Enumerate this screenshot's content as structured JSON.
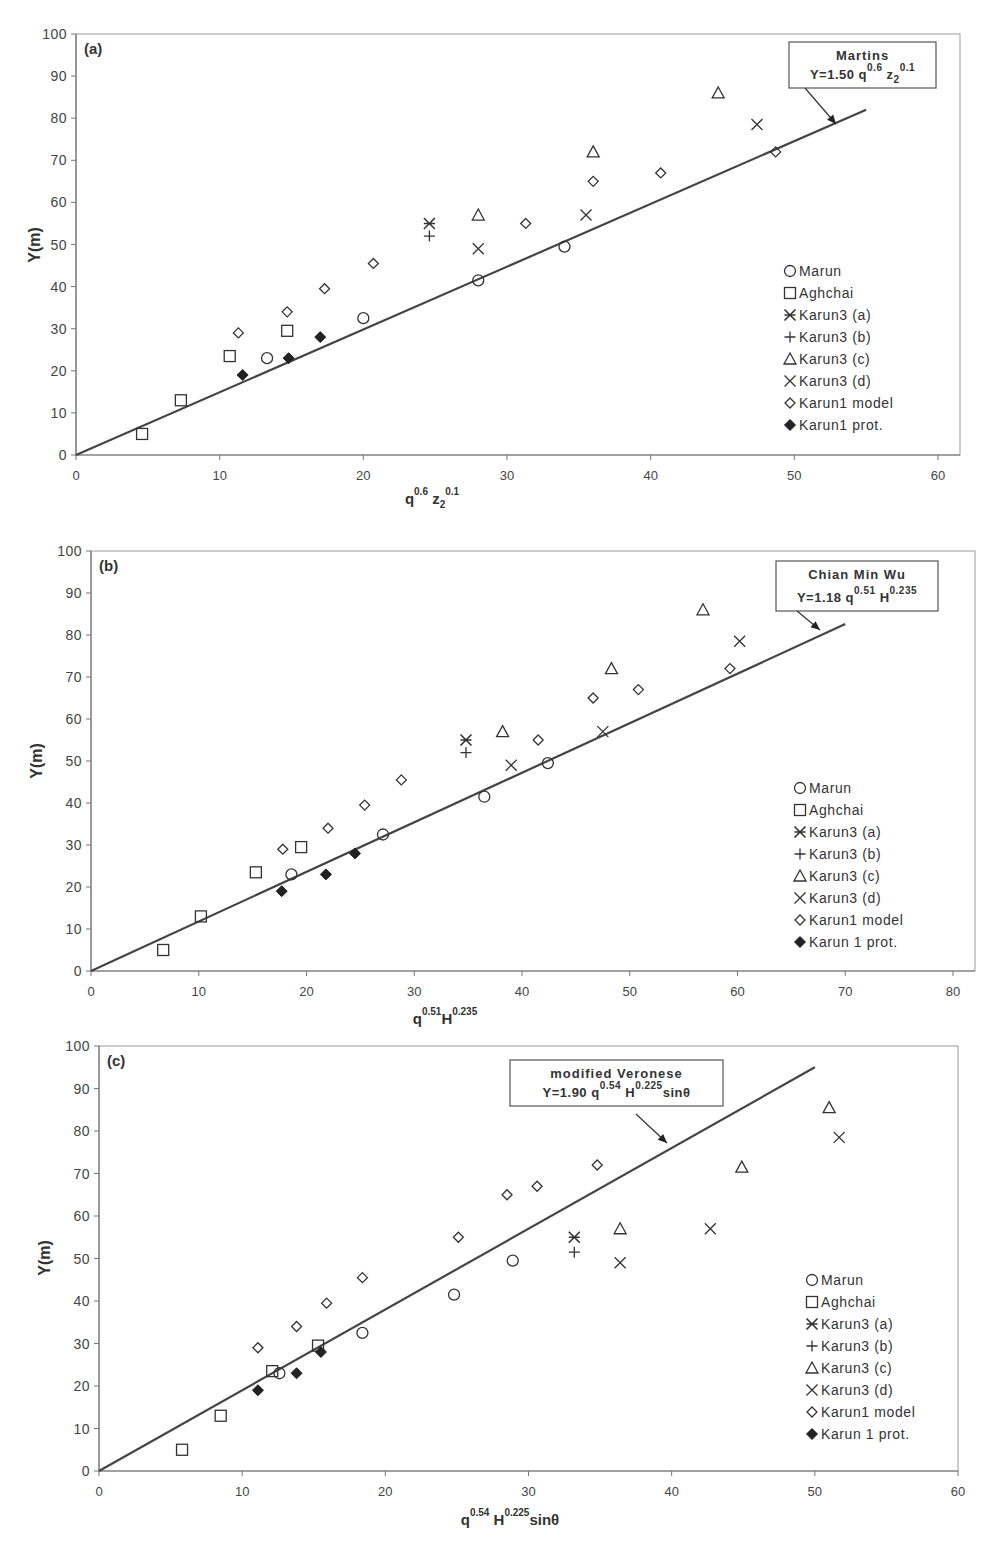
{
  "legend_labels_a": [
    "Marun",
    "Aghchai",
    "Karun3 (a)",
    "Karun3 (b)",
    "Karun3 (c)",
    "Karun3 (d)",
    "Karun1 model",
    "Karun1 prot."
  ],
  "legend_labels_b": [
    "Marun",
    "Aghchai",
    "Karun3 (a)",
    "Karun3 (b)",
    "Karun3 (c)",
    "Karun3 (d)",
    "Karun1 model",
    "Karun 1 prot."
  ],
  "legend_labels_c": [
    "Marun",
    "Aghchai",
    "Karun3 (a)",
    "Karun3 (b)",
    "Karun3 (c)",
    "Karun3 (d)",
    "Karun1 model",
    "Karun 1 prot."
  ],
  "charts": {
    "a": {
      "panel_label": "(a)",
      "ylabel": "Y(m)",
      "xlabel_base": [
        "q",
        "z"
      ],
      "xlabel_sup": [
        "0.6",
        "0.1"
      ],
      "xlabel_sub": "2",
      "box_title": "Martins",
      "box_eq_prefix": "Y=1.50 q",
      "box_eq_sup1": "0.6",
      "box_eq_mid": " z",
      "box_eq_sub": "2",
      "box_eq_sup2": "0.1"
    },
    "b": {
      "panel_label": "(b)",
      "ylabel": "Y(m)",
      "xlabel_base": [
        "q",
        "H"
      ],
      "xlabel_sup": [
        "0.51",
        "0.235"
      ],
      "box_title": "Chian Min Wu",
      "box_eq_prefix": "Y=1.18 q",
      "box_eq_sup1": "0.51",
      "box_eq_mid": " H",
      "box_eq_sup2": "0.235"
    },
    "c": {
      "panel_label": "(c)",
      "ylabel": "Y(m)",
      "xlabel_base": [
        "q",
        " H",
        "sinθ"
      ],
      "xlabel_sup": [
        "0.54",
        "0.225"
      ],
      "box_title": "modified Veronese",
      "box_eq_prefix": "Y=1.90 q",
      "box_eq_sup1": "0.54",
      "box_eq_mid": " H",
      "box_eq_sup2": "0.225",
      "box_eq_suffix": "sinθ"
    }
  },
  "chart_data": [
    {
      "type": "scatter",
      "title": "(a) Martins: Y=1.50 q^0.6 z2^0.1",
      "xlabel": "q^0.6 z2^0.1",
      "ylabel": "Y(m)",
      "xlim": [
        0,
        60
      ],
      "ylim": [
        0,
        100
      ],
      "xticks": [
        0,
        10,
        20,
        30,
        40,
        50,
        60
      ],
      "yticks": [
        0,
        10,
        20,
        30,
        40,
        50,
        60,
        70,
        80,
        90,
        100
      ],
      "grid": false,
      "legend_position": "right-middle",
      "fit_line": {
        "name": "Martins",
        "equation": "Y=1.50 q^0.6 z2^0.1",
        "x": [
          0,
          55
        ],
        "y": [
          0,
          82
        ]
      },
      "series": [
        {
          "name": "Marun",
          "marker": "circle-open",
          "points": [
            [
              13.3,
              23
            ],
            [
              20,
              32.5
            ],
            [
              28,
              41.5
            ],
            [
              34,
              49.5
            ]
          ]
        },
        {
          "name": "Aghchai",
          "marker": "square-open",
          "points": [
            [
              4.6,
              5
            ],
            [
              7.3,
              13
            ],
            [
              10.7,
              23.5
            ],
            [
              14.7,
              29.5
            ]
          ]
        },
        {
          "name": "Karun3 (a)",
          "marker": "asterisk",
          "points": [
            [
              24.6,
              55
            ]
          ]
        },
        {
          "name": "Karun3 (b)",
          "marker": "plus",
          "points": [
            [
              24.6,
              52
            ]
          ]
        },
        {
          "name": "Karun3 (c)",
          "marker": "triangle-open",
          "points": [
            [
              28,
              57
            ],
            [
              36,
              72
            ],
            [
              44.7,
              86
            ]
          ]
        },
        {
          "name": "Karun3 (d)",
          "marker": "x",
          "points": [
            [
              28,
              49
            ],
            [
              35.5,
              57
            ],
            [
              47.4,
              78.5
            ]
          ]
        },
        {
          "name": "Karun1 model",
          "marker": "diamond-open",
          "points": [
            [
              11.3,
              29
            ],
            [
              14.7,
              34
            ],
            [
              17.3,
              39.5
            ],
            [
              20.7,
              45.5
            ],
            [
              31.3,
              55
            ],
            [
              36,
              65
            ],
            [
              40.7,
              67
            ],
            [
              48.7,
              72
            ]
          ]
        },
        {
          "name": "Karun1 prot.",
          "marker": "diamond-filled",
          "points": [
            [
              11.6,
              19
            ],
            [
              14.8,
              23
            ],
            [
              17,
              28
            ]
          ]
        }
      ]
    },
    {
      "type": "scatter",
      "title": "(b) Chian Min Wu: Y=1.18 q^0.51 H^0.235",
      "xlabel": "q^0.51 H^0.235",
      "ylabel": "Y(m)",
      "xlim": [
        0,
        80
      ],
      "ylim": [
        0,
        100
      ],
      "xticks": [
        0,
        10,
        20,
        30,
        40,
        50,
        60,
        70,
        80
      ],
      "yticks": [
        0,
        10,
        20,
        30,
        40,
        50,
        60,
        70,
        80,
        90,
        100
      ],
      "grid": false,
      "legend_position": "right-middle",
      "fit_line": {
        "name": "Chian Min Wu",
        "equation": "Y=1.18 q^0.51 H^0.235",
        "x": [
          0,
          70
        ],
        "y": [
          0,
          82.6
        ]
      },
      "series": [
        {
          "name": "Marun",
          "marker": "circle-open",
          "points": [
            [
              18.6,
              23
            ],
            [
              27.1,
              32.5
            ],
            [
              36.5,
              41.5
            ],
            [
              42.4,
              49.5
            ]
          ]
        },
        {
          "name": "Aghchai",
          "marker": "square-open",
          "points": [
            [
              6.7,
              5
            ],
            [
              10.2,
              13
            ],
            [
              15.3,
              23.5
            ],
            [
              19.5,
              29.5
            ]
          ]
        },
        {
          "name": "Karun3 (a)",
          "marker": "asterisk",
          "points": [
            [
              34.8,
              55
            ]
          ]
        },
        {
          "name": "Karun3 (b)",
          "marker": "plus",
          "points": [
            [
              34.8,
              52
            ]
          ]
        },
        {
          "name": "Karun3 (c)",
          "marker": "triangle-open",
          "points": [
            [
              38.2,
              57
            ],
            [
              48.3,
              72
            ],
            [
              56.8,
              86
            ]
          ]
        },
        {
          "name": "Karun3 (d)",
          "marker": "x",
          "points": [
            [
              39,
              49
            ],
            [
              47.5,
              57
            ],
            [
              60.2,
              78.5
            ]
          ]
        },
        {
          "name": "Karun1 model",
          "marker": "diamond-open",
          "points": [
            [
              17.8,
              29
            ],
            [
              22,
              34
            ],
            [
              25.4,
              39.5
            ],
            [
              28.8,
              45.5
            ],
            [
              41.5,
              55
            ],
            [
              46.6,
              65
            ],
            [
              50.8,
              67
            ],
            [
              59.3,
              72
            ]
          ]
        },
        {
          "name": "Karun 1 prot.",
          "marker": "diamond-filled",
          "points": [
            [
              17.7,
              19
            ],
            [
              21.8,
              23
            ],
            [
              24.5,
              28
            ]
          ]
        }
      ]
    },
    {
      "type": "scatter",
      "title": "(c) modified Veronese: Y=1.90 q^0.54 H^0.225 sinθ",
      "xlabel": "q^0.54 H^0.225 sinθ",
      "ylabel": "Y(m)",
      "xlim": [
        0,
        60
      ],
      "ylim": [
        0,
        100
      ],
      "xticks": [
        0,
        10,
        20,
        30,
        40,
        50,
        60
      ],
      "yticks": [
        0,
        10,
        20,
        30,
        40,
        50,
        60,
        70,
        80,
        90,
        100
      ],
      "grid": false,
      "legend_position": "right-lower",
      "fit_line": {
        "name": "modified Veronese",
        "equation": "Y=1.90 q^0.54 H^0.225 sinθ",
        "x": [
          0,
          50
        ],
        "y": [
          0,
          95
        ]
      },
      "series": [
        {
          "name": "Marun",
          "marker": "circle-open",
          "points": [
            [
              12.6,
              23
            ],
            [
              18.4,
              32.5
            ],
            [
              24.8,
              41.5
            ],
            [
              28.9,
              49.5
            ]
          ]
        },
        {
          "name": "Aghchai",
          "marker": "square-open",
          "points": [
            [
              5.8,
              5
            ],
            [
              8.5,
              13
            ],
            [
              12.1,
              23.5
            ],
            [
              15.3,
              29.5
            ]
          ]
        },
        {
          "name": "Karun3 (a)",
          "marker": "asterisk",
          "points": [
            [
              33.2,
              55
            ]
          ]
        },
        {
          "name": "Karun3 (b)",
          "marker": "plus",
          "points": [
            [
              33.2,
              51.5
            ]
          ]
        },
        {
          "name": "Karun3 (c)",
          "marker": "triangle-open",
          "points": [
            [
              36.4,
              57
            ],
            [
              44.9,
              71.5
            ],
            [
              51,
              85.5
            ]
          ]
        },
        {
          "name": "Karun3 (d)",
          "marker": "x",
          "points": [
            [
              36.4,
              49
            ],
            [
              42.7,
              57
            ],
            [
              51.7,
              78.5
            ]
          ]
        },
        {
          "name": "Karun1 model",
          "marker": "diamond-open",
          "points": [
            [
              11.1,
              29
            ],
            [
              13.8,
              34
            ],
            [
              15.9,
              39.5
            ],
            [
              18.4,
              45.5
            ],
            [
              25.1,
              55
            ],
            [
              28.5,
              65
            ],
            [
              30.6,
              67
            ],
            [
              34.8,
              72
            ]
          ]
        },
        {
          "name": "Karun 1 prot.",
          "marker": "diamond-filled",
          "points": [
            [
              11.1,
              19
            ],
            [
              13.8,
              23
            ],
            [
              15.5,
              28
            ]
          ]
        }
      ]
    }
  ]
}
